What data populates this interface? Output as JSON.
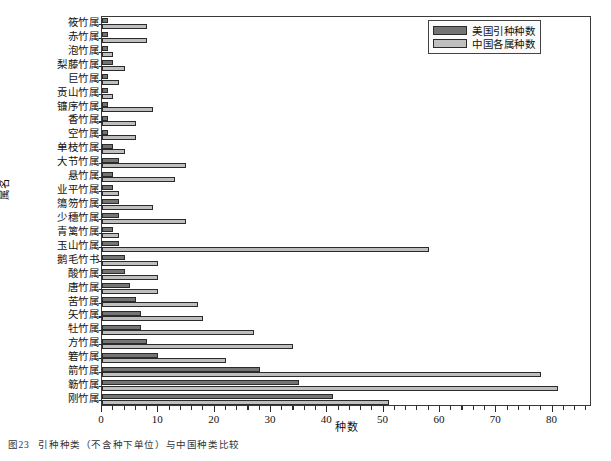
{
  "figure": {
    "caption_number": "图23",
    "caption_text": "引种种类（不含种下单位）与中国种类比较"
  },
  "legend": {
    "position": "top-right",
    "entries": [
      {
        "label": "美国引种种数",
        "color": "#747474"
      },
      {
        "label": "中国各属种数",
        "color": "#bfbfbf"
      }
    ]
  },
  "axes": {
    "xlabel": "种数",
    "ylabel": "属名",
    "xlim": [
      0,
      87
    ],
    "xticks": [
      0,
      10,
      20,
      30,
      40,
      50,
      60,
      70,
      80
    ],
    "xticklabels": [
      "0",
      "10",
      "20",
      "30",
      "40",
      "50",
      "60",
      "70",
      "80"
    ],
    "x_minor_step": 2,
    "grid": false
  },
  "chart_data": {
    "type": "bar",
    "orientation": "horizontal",
    "title": "引种种类（不含种下单位）与中国种类比较",
    "xlabel": "种数",
    "ylabel": "属名",
    "xlim": [
      0,
      87
    ],
    "grid": false,
    "legend_position": "upper right",
    "categories": [
      "筱竹属",
      "赤竹属",
      "泡竹属",
      "梨藤竹属",
      "巨竹属",
      "贡山竹属",
      "镰序竹属",
      "香竹属",
      "空竹属",
      "单枝竹属",
      "大节竹属",
      "悬竹属",
      "业平竹属",
      "簜笏竹属",
      "少穗竹属",
      "青篱竹属",
      "玉山竹属",
      "鹅毛竹书",
      "酸竹属",
      "唐竹属",
      "苦竹属",
      "矢竹属",
      "牡竹属",
      "方竹属",
      "箬竹属",
      "箭竹属",
      "簕竹属",
      "刚竹属"
    ],
    "series": [
      {
        "name": "美国引种种数",
        "color": "#747474",
        "values": [
          1,
          1,
          1,
          2,
          1,
          1,
          1,
          1,
          1,
          2,
          3,
          2,
          2,
          3,
          3,
          2,
          3,
          4,
          4,
          5,
          6,
          7,
          7,
          8,
          10,
          28,
          35,
          41
        ]
      },
      {
        "name": "中国各属种数",
        "color": "#bfbfbf",
        "values": [
          8,
          8,
          2,
          4,
          3,
          2,
          9,
          6,
          6,
          4,
          15,
          13,
          3,
          9,
          15,
          3,
          58,
          10,
          10,
          10,
          17,
          18,
          27,
          34,
          22,
          78,
          81,
          51
        ]
      }
    ]
  }
}
